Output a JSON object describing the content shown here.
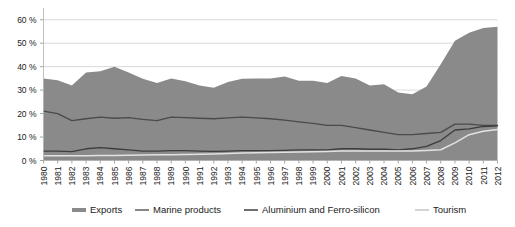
{
  "chart_data": {
    "type": "area",
    "title": "",
    "subtitle": "",
    "xlabel": "",
    "ylabel": "",
    "ylim": [
      0,
      65
    ],
    "xlim": [
      1980,
      2012
    ],
    "grid": true,
    "legend_position": "bottom",
    "ytick_labels": [
      "0 %",
      "10 %",
      "20 %",
      "30 %",
      "40 %",
      "50 %",
      "60 %"
    ],
    "ytick_values": [
      0,
      10,
      20,
      30,
      40,
      50,
      60
    ],
    "categories": [
      "1980",
      "1981",
      "1982",
      "1983",
      "1984",
      "1985",
      "1986",
      "1987",
      "1988",
      "1989",
      "1990",
      "1991",
      "1992",
      "1993",
      "1994",
      "1995",
      "1996",
      "1997",
      "1998",
      "1999",
      "2000",
      "2001",
      "2002",
      "2003",
      "2004",
      "2005",
      "2006",
      "2007",
      "2008",
      "2009",
      "2010",
      "2011",
      "2012"
    ],
    "series": [
      {
        "name": "Exports",
        "style": "area",
        "color": "#8a8a8a",
        "values": [
          35.0,
          34.2,
          32.0,
          37.5,
          38.0,
          40.0,
          37.5,
          34.8,
          33.0,
          35.0,
          33.8,
          32.0,
          31.0,
          33.5,
          34.8,
          35.0,
          35.0,
          35.8,
          34.0,
          34.0,
          33.0,
          36.0,
          35.0,
          32.0,
          32.5,
          29.0,
          28.2,
          31.5,
          41.0,
          51.0,
          54.5,
          56.5,
          57.0
        ]
      },
      {
        "name": "Marine products",
        "style": "line",
        "color": "#4a4a4a",
        "values": [
          21.0,
          20.0,
          17.0,
          17.8,
          18.5,
          18.0,
          18.3,
          17.5,
          17.0,
          18.5,
          18.3,
          18.0,
          17.8,
          18.2,
          18.5,
          18.2,
          17.8,
          17.2,
          16.5,
          15.8,
          15.0,
          15.0,
          14.0,
          13.0,
          12.0,
          11.0,
          11.0,
          11.5,
          12.0,
          15.5,
          15.5,
          15.0,
          15.0
        ]
      },
      {
        "name": "Aluminium and Ferro-silicon",
        "style": "line",
        "color": "#3c3c3c",
        "values": [
          4.0,
          4.0,
          3.8,
          5.0,
          5.5,
          5.0,
          4.5,
          4.0,
          4.0,
          4.2,
          4.2,
          4.0,
          3.9,
          4.0,
          4.2,
          4.2,
          4.2,
          4.3,
          4.5,
          4.5,
          4.5,
          5.0,
          5.0,
          4.8,
          4.8,
          4.5,
          5.0,
          6.0,
          8.5,
          13.0,
          13.5,
          14.5,
          14.8
        ]
      },
      {
        "name": "Tourism",
        "style": "line",
        "color": "#e2e2e2",
        "values": [
          2.0,
          2.0,
          2.0,
          2.0,
          2.1,
          2.1,
          2.2,
          2.3,
          2.4,
          2.5,
          2.6,
          2.7,
          2.8,
          3.0,
          3.2,
          3.3,
          3.4,
          3.5,
          3.6,
          3.7,
          3.8,
          4.0,
          4.1,
          4.0,
          4.0,
          4.0,
          4.1,
          4.3,
          4.6,
          7.5,
          11.0,
          12.5,
          13.2
        ]
      }
    ],
    "legend": [
      {
        "label": "Exports",
        "color": "#8a8a8a",
        "swatch": "thick-bar"
      },
      {
        "label": "Marine products",
        "color": "#6a6a6a",
        "swatch": "line"
      },
      {
        "label": "Aluminium and Ferro-silicon",
        "color": "#4a4a4a",
        "swatch": "line"
      },
      {
        "label": "Tourism",
        "color": "#c8c8c8",
        "swatch": "line"
      }
    ]
  }
}
